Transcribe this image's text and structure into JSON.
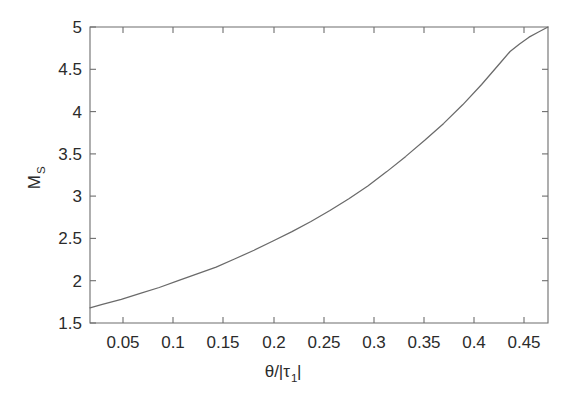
{
  "figure": {
    "background_color": "#ffffff",
    "axis_color": "#6d6d6d",
    "curve_color": "#6a6a6a"
  },
  "chart_data": {
    "type": "line",
    "title": "",
    "xlabel": "θ/|τ₁|",
    "xlabel_main": "θ/|τ",
    "xlabel_sub": "1",
    "xlabel_tail": "|",
    "ylabel": "M_S",
    "ylabel_main": "M",
    "ylabel_sub": "S",
    "xlim": [
      0.017,
      0.5
    ],
    "ylim": [
      1.5,
      5.0
    ],
    "grid": false,
    "legend": "none",
    "xticks": [
      0.05,
      0.1,
      0.15,
      0.2,
      0.25,
      0.3,
      0.35,
      0.4,
      0.45
    ],
    "xtick_labels": [
      "0.05",
      "0.1",
      "0.15",
      "0.2",
      "0.25",
      "0.3",
      "0.35",
      "0.4",
      "0.45"
    ],
    "yticks": [
      1.5,
      2,
      2.5,
      3,
      3.5,
      4,
      4.5,
      5
    ],
    "ytick_labels": [
      "1.5",
      "2",
      "2.5",
      "3",
      "3.5",
      "4",
      "4.5",
      "5"
    ],
    "series": [
      {
        "name": "M_S",
        "x": [
          0.017,
          0.03,
          0.05,
          0.07,
          0.09,
          0.11,
          0.13,
          0.15,
          0.17,
          0.19,
          0.21,
          0.23,
          0.25,
          0.27,
          0.29,
          0.31,
          0.33,
          0.35,
          0.37,
          0.39,
          0.41,
          0.43,
          0.45,
          0.46,
          0.47,
          0.48,
          0.49,
          0.495,
          0.5
        ],
        "y": [
          1.68,
          1.72,
          1.78,
          1.85,
          1.92,
          2.0,
          2.08,
          2.16,
          2.26,
          2.36,
          2.47,
          2.58,
          2.7,
          2.83,
          2.97,
          3.12,
          3.29,
          3.47,
          3.66,
          3.86,
          4.08,
          4.32,
          4.58,
          4.71,
          4.8,
          4.88,
          4.94,
          4.97,
          5.0
        ]
      }
    ]
  }
}
